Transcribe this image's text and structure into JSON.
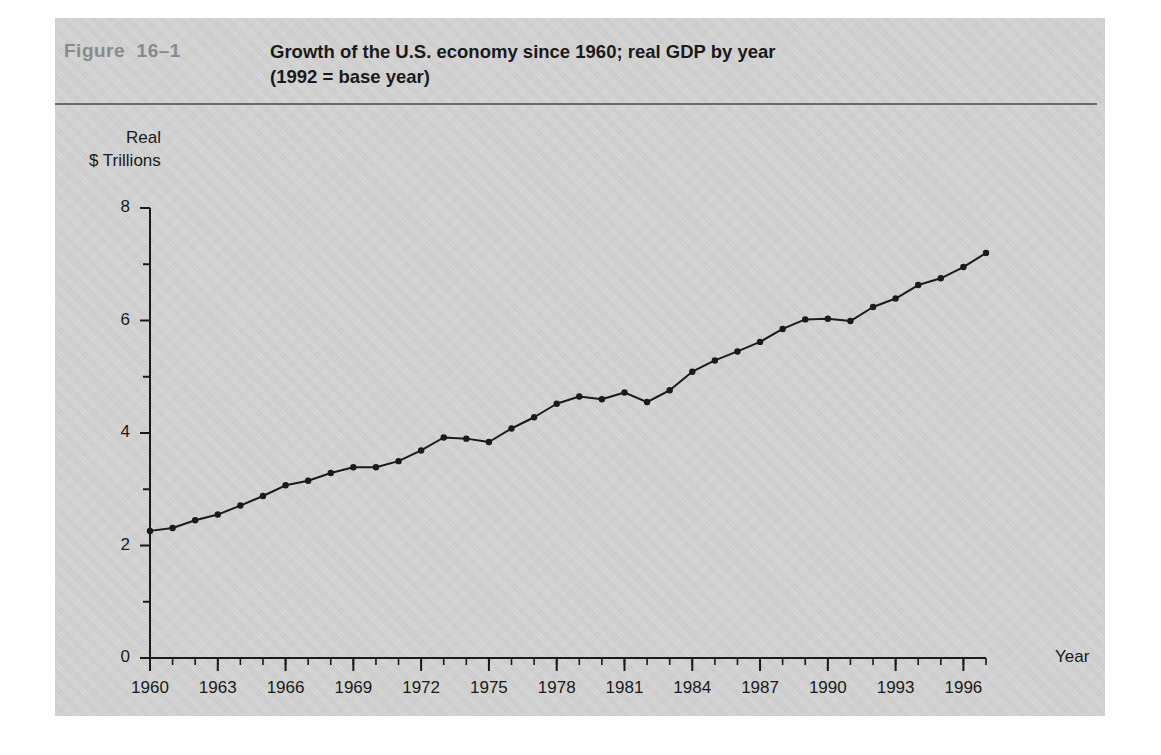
{
  "figure": {
    "label": "Figure  16–1",
    "title_line1": "Growth of the U.S. economy since 1960; real GDP by year",
    "title_line2": "(1992 = base year)",
    "panel_color": "#d2d2d2",
    "label_color": "#8a8a8a",
    "rule_color": "#6b6b6b",
    "line_color": "#1a1a1a"
  },
  "axes": {
    "y_caption_line1": "Real",
    "y_caption_line2": "$ Trillions",
    "x_caption": "Year",
    "y_ticks": [
      "0",
      "2",
      "4",
      "6",
      "8"
    ],
    "x_ticks": [
      "1960",
      "1963",
      "1966",
      "1969",
      "1972",
      "1975",
      "1978",
      "1981",
      "1984",
      "1987",
      "1990",
      "1993",
      "1996"
    ]
  },
  "chart_data": {
    "type": "line",
    "title": "Growth of the U.S. economy since 1960; real GDP by year (1992 = base year)",
    "xlabel": "Year",
    "ylabel": "Real $ Trillions",
    "xlim": [
      1960,
      1997
    ],
    "ylim": [
      0,
      8
    ],
    "ytick_values": [
      0,
      2,
      4,
      6,
      8
    ],
    "ytick_labels": [
      "0",
      "2",
      "4",
      "6",
      "8"
    ],
    "xtick_values": [
      1960,
      1963,
      1966,
      1969,
      1972,
      1975,
      1978,
      1981,
      1984,
      1987,
      1990,
      1993,
      1996
    ],
    "xtick_labels": [
      "1960",
      "1963",
      "1966",
      "1969",
      "1972",
      "1975",
      "1978",
      "1981",
      "1984",
      "1987",
      "1990",
      "1993",
      "1996"
    ],
    "minor_xticks": "every 1 year",
    "minor_yticks": "every 1 trillion",
    "grid": false,
    "legend": false,
    "markers": true,
    "x": [
      1960,
      1961,
      1962,
      1963,
      1964,
      1965,
      1966,
      1967,
      1968,
      1969,
      1970,
      1971,
      1972,
      1973,
      1974,
      1975,
      1976,
      1977,
      1978,
      1979,
      1980,
      1981,
      1982,
      1983,
      1984,
      1985,
      1986,
      1987,
      1988,
      1989,
      1990,
      1991,
      1992,
      1993,
      1994,
      1995,
      1996,
      1997
    ],
    "values": [
      2.26,
      2.31,
      2.45,
      2.55,
      2.71,
      2.88,
      3.07,
      3.15,
      3.29,
      3.39,
      3.39,
      3.5,
      3.69,
      3.92,
      3.9,
      3.84,
      4.08,
      4.28,
      4.52,
      4.65,
      4.6,
      4.72,
      4.55,
      4.76,
      5.09,
      5.29,
      5.45,
      5.62,
      5.85,
      6.02,
      6.03,
      5.99,
      6.24,
      6.39,
      6.63,
      6.75,
      6.95,
      7.2
    ],
    "series": [
      {
        "name": "Real GDP",
        "values": [
          2.26,
          2.31,
          2.45,
          2.55,
          2.71,
          2.88,
          3.07,
          3.15,
          3.29,
          3.39,
          3.39,
          3.5,
          3.69,
          3.92,
          3.9,
          3.84,
          4.08,
          4.28,
          4.52,
          4.65,
          4.6,
          4.72,
          4.55,
          4.76,
          5.09,
          5.29,
          5.45,
          5.62,
          5.85,
          6.02,
          6.03,
          5.99,
          6.24,
          6.39,
          6.63,
          6.75,
          6.95,
          7.2
        ]
      }
    ]
  }
}
